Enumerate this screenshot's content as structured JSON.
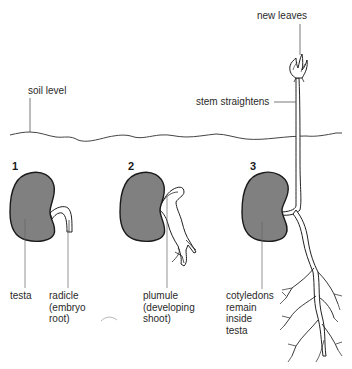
{
  "colors": {
    "seed_fill": "#808080",
    "outline": "#1a1a1a",
    "line": "#555555",
    "background": "#ffffff"
  },
  "stages": [
    {
      "number": "1",
      "labels": [
        "testa",
        "radicle\n(embryo\nroot)"
      ]
    },
    {
      "number": "2",
      "labels": [
        "plumule\n(developing\nshoot)"
      ]
    },
    {
      "number": "3",
      "labels": [
        "cotyledons\nremain\ninside\ntesta"
      ]
    }
  ],
  "annotations": {
    "soil_level": "soil level",
    "new_leaves": "new leaves",
    "stem_straightens": "stem straightens",
    "testa": "testa",
    "radicle": "radicle\n(embryo\nroot)",
    "plumule": "plumule\n(developing\nshoot)",
    "cotyledons": "cotyledons\nremain\ninside\ntesta"
  }
}
